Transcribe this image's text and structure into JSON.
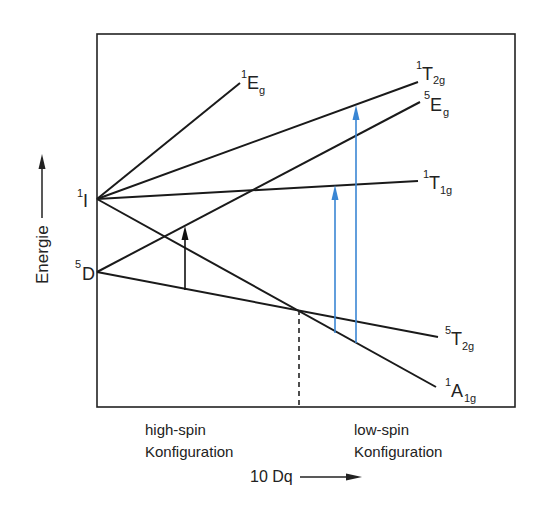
{
  "diagram": {
    "type": "Tanabe-Sugano-like term diagram (Fe(II) d6, spin crossover)",
    "y_axis_label": "Energie",
    "x_axis_label": "10 Dq",
    "left_terms": [
      {
        "id": "1I",
        "sup": "1",
        "base": "I"
      },
      {
        "id": "5D",
        "sup": "5",
        "base": "D"
      }
    ],
    "right_terms": [
      {
        "id": "1Eg",
        "sup": "1",
        "base": "E",
        "sub": "g",
        "from": "1I"
      },
      {
        "id": "1T2g",
        "sup": "1",
        "base": "T",
        "sub": "2g",
        "from": "1I"
      },
      {
        "id": "5Eg",
        "sup": "5",
        "base": "E",
        "sub": "g",
        "from": "5D"
      },
      {
        "id": "1T1g",
        "sup": "1",
        "base": "T",
        "sub": "1g",
        "from": "1I"
      },
      {
        "id": "5T2g",
        "sup": "5",
        "base": "T",
        "sub": "2g",
        "from": "5D"
      },
      {
        "id": "1A1g",
        "sup": "1",
        "base": "A",
        "sub": "1g",
        "from": "1I"
      }
    ],
    "regions": {
      "high_spin": {
        "line1": "high-spin",
        "line2": "Konfiguration"
      },
      "low_spin": {
        "line1": "low-spin",
        "line2": "Konfiguration"
      }
    },
    "transitions": [
      {
        "from": "5T2g",
        "to": "5Eg",
        "color": "#111111",
        "region": "high-spin"
      },
      {
        "from": "1A1g",
        "to": "1T1g",
        "color": "#3a86d4",
        "region": "low-spin"
      },
      {
        "from": "1A1g",
        "to": "1T2g",
        "color": "#3a86d4",
        "region": "low-spin"
      }
    ],
    "crossover_marker": "dashed vertical line at 5T2g/1A1g crossing",
    "colors": {
      "line": "#1a1a1a",
      "blue_arrow": "#3a86d4",
      "background": "#ffffff"
    }
  }
}
